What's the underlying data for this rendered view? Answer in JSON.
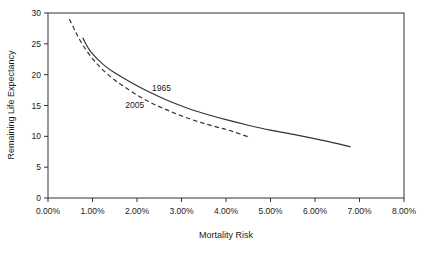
{
  "chart_data": {
    "type": "line",
    "title": "",
    "xlabel": "Mortality Risk",
    "ylabel": "Remaining Life Expectancy",
    "xlim": [
      0,
      8
    ],
    "ylim": [
      0,
      30
    ],
    "xtick_labels": [
      "0.00%",
      "1.00%",
      "2.00%",
      "3.00%",
      "4.00%",
      "5.00%",
      "6.00%",
      "7.00%",
      "8.00%"
    ],
    "xtick_values": [
      0,
      1,
      2,
      3,
      4,
      5,
      6,
      7,
      8
    ],
    "ytick_labels": [
      "0",
      "5",
      "10",
      "15",
      "20",
      "25",
      "30"
    ],
    "ytick_values": [
      0,
      5,
      10,
      15,
      20,
      25,
      30
    ],
    "grid": false,
    "legend_position": "inline-annotations",
    "series": [
      {
        "name": "1965",
        "style": "solid",
        "color": "#333333",
        "label_x": 2.55,
        "label_y": 17.4,
        "x": [
          0.78,
          0.85,
          0.95,
          1.1,
          1.3,
          1.5,
          1.75,
          2.0,
          2.3,
          2.6,
          2.9,
          3.2,
          3.6,
          4.0,
          4.5,
          5.0,
          5.6,
          6.2,
          6.8
        ],
        "y": [
          26.0,
          25.0,
          23.8,
          22.6,
          21.3,
          20.3,
          19.2,
          18.2,
          17.1,
          16.1,
          15.2,
          14.4,
          13.5,
          12.7,
          11.8,
          11.0,
          10.2,
          9.3,
          8.3
        ]
      },
      {
        "name": "2005",
        "style": "dashed",
        "color": "#333333",
        "label_x": 1.95,
        "label_y": 14.6,
        "x": [
          0.48,
          0.55,
          0.65,
          0.8,
          1.0,
          1.2,
          1.45,
          1.7,
          2.0,
          2.3,
          2.6,
          2.9,
          3.2,
          3.5,
          3.8,
          4.1,
          4.55
        ],
        "y": [
          29.0,
          28.0,
          26.5,
          24.6,
          22.6,
          21.0,
          19.4,
          18.1,
          16.7,
          15.5,
          14.5,
          13.6,
          12.8,
          12.1,
          11.5,
          10.9,
          9.8
        ]
      }
    ]
  },
  "axes": {
    "xlabel": "Mortality Risk",
    "ylabel": "Remaining Life Expectancy"
  }
}
